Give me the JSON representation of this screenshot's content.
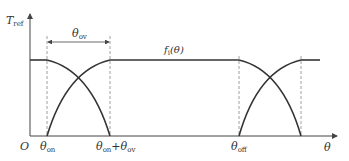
{
  "diagram": {
    "type": "reference torque profile",
    "y_axis": {
      "symbol": "T",
      "subscript": "ref"
    },
    "x_axis": {
      "symbol": "θ"
    },
    "origin_label": "O",
    "overlap_label": {
      "symbol": "θ",
      "subscript": "ov"
    },
    "function_label": {
      "prefix": "f",
      "subscript": "i",
      "arg": "(θ)"
    },
    "tick_labels": [
      {
        "symbol": "θ",
        "subscript": "on",
        "suffix": ""
      },
      {
        "symbol": "θ",
        "subscript": "on",
        "suffix": "+θ",
        "suffix_sub": "ov"
      },
      {
        "symbol": "θ",
        "subscript": "off",
        "suffix": ""
      }
    ],
    "colors": {
      "curve": "#333333",
      "axis": "#444444",
      "dashed": "#888888",
      "background": "#ffffff"
    }
  }
}
